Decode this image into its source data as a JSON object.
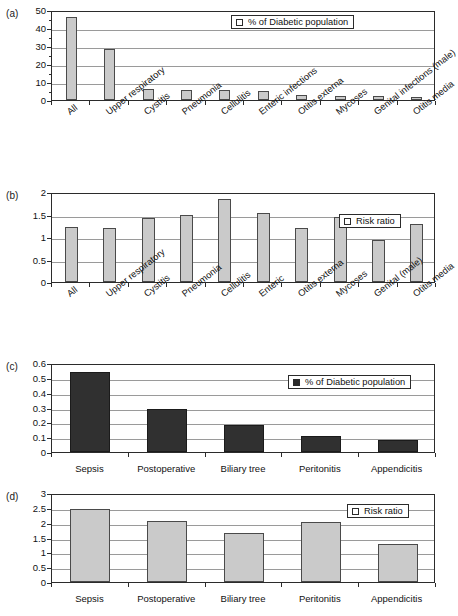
{
  "figure": {
    "panels": [
      {
        "letter": "(a)",
        "legend_label": "% of Diabetic population",
        "legend_style": "light"
      },
      {
        "letter": "(b)",
        "legend_label": "Risk ratio",
        "legend_style": "light"
      },
      {
        "letter": "(c)",
        "legend_label": "% of Diabetic population",
        "legend_style": "dark"
      },
      {
        "letter": "(d)",
        "legend_label": "Risk ratio",
        "legend_style": "light"
      }
    ]
  },
  "chart_data": [
    {
      "type": "bar",
      "panel": "(a)",
      "title": "",
      "xlabel": "",
      "ylabel": "",
      "ylim": [
        0,
        50
      ],
      "yticks": [
        0,
        10,
        20,
        30,
        40,
        50
      ],
      "ytick_labels": [
        "0",
        "10",
        "20",
        "30",
        "40",
        "50"
      ],
      "minor_tick_step": 5,
      "grid": true,
      "legend": [
        "% of Diabetic population"
      ],
      "legend_position": "top-right",
      "bar_color": "#cacaca",
      "categories": [
        "All",
        "Upper respiratory",
        "Cystitis",
        "Pneumonia",
        "Cellulitis",
        "Enteric infections",
        "Otitis externa",
        "Mycoses",
        "Genital infections (male)",
        "Otitis media"
      ],
      "values": [
        46,
        28.5,
        6,
        5.5,
        5.6,
        5,
        2.6,
        2.2,
        2.3,
        1.7
      ]
    },
    {
      "type": "bar",
      "panel": "(b)",
      "title": "",
      "xlabel": "",
      "ylabel": "",
      "ylim": [
        0,
        2
      ],
      "yticks": [
        0,
        0.5,
        1,
        1.5,
        2
      ],
      "ytick_labels": [
        "0",
        "0.5",
        "1",
        "1.5",
        "2"
      ],
      "grid": true,
      "legend": [
        "Risk ratio"
      ],
      "legend_position": "top-right",
      "bar_color": "#cacaca",
      "categories": [
        "All",
        "Upper respiratory",
        "Cystitis",
        "Pneumonia",
        "Cellulitis",
        "Enteric",
        "Otitis externa",
        "Mycoses",
        "Genital (male)",
        "Otitis media"
      ],
      "values": [
        1.22,
        1.19,
        1.42,
        1.49,
        1.85,
        1.54,
        1.19,
        1.44,
        0.94,
        1.28
      ]
    },
    {
      "type": "bar",
      "panel": "(c)",
      "title": "",
      "xlabel": "",
      "ylabel": "",
      "ylim": [
        0,
        0.6
      ],
      "yticks": [
        0,
        0.1,
        0.2,
        0.3,
        0.4,
        0.5,
        0.6
      ],
      "ytick_labels": [
        "0",
        "0.1",
        "0.2",
        "0.3",
        "0.4",
        "0.5",
        "0.6"
      ],
      "grid": true,
      "legend": [
        "% of Diabetic population"
      ],
      "legend_position": "top-right",
      "bar_color": "#303030",
      "categories": [
        "Sepsis",
        "Postoperative",
        "Biliary tree",
        "Peritonitis",
        "Appendicitis"
      ],
      "values": [
        0.54,
        0.29,
        0.18,
        0.11,
        0.08
      ]
    },
    {
      "type": "bar",
      "panel": "(d)",
      "title": "",
      "xlabel": "",
      "ylabel": "",
      "ylim": [
        0,
        3
      ],
      "yticks": [
        0,
        0.5,
        1,
        1.5,
        2,
        2.5,
        3
      ],
      "ytick_labels": [
        "0",
        "0.5",
        "1",
        "1.5",
        "2",
        "2.5",
        "3"
      ],
      "grid": true,
      "legend": [
        "Risk ratio"
      ],
      "legend_position": "top-right",
      "bar_color": "#cacaca",
      "categories": [
        "Sepsis",
        "Postoperative",
        "Biliary tree",
        "Peritonitis",
        "Appendicitis"
      ],
      "values": [
        2.46,
        2.04,
        1.65,
        2.03,
        1.28
      ]
    }
  ]
}
